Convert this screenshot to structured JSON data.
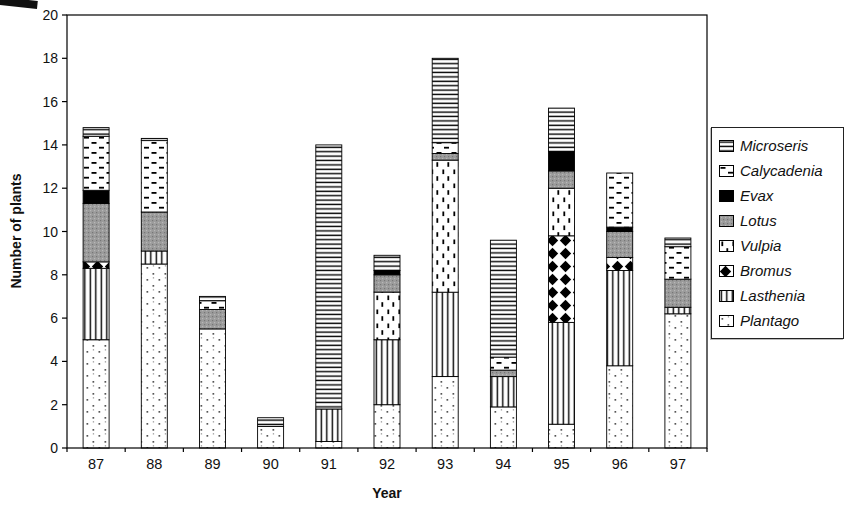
{
  "figure": {
    "background": "#ffffff",
    "axis_color": "#000000",
    "text_color": "#111111"
  },
  "chart_data": {
    "type": "stacked-bar",
    "xlabel": "Year",
    "ylabel": "Number of plants",
    "categories": [
      "87",
      "88",
      "89",
      "90",
      "91",
      "92",
      "93",
      "94",
      "95",
      "96",
      "97"
    ],
    "ylim": [
      0,
      20
    ],
    "yticks": [
      0,
      2,
      4,
      6,
      8,
      10,
      12,
      14,
      16,
      18,
      20
    ],
    "grid": false,
    "legend_position": "right",
    "bar_outline_color": "#000000",
    "series": [
      {
        "name": "Plantago",
        "pattern": "dots",
        "fill_colors": [
          "#ffffff",
          "#444444"
        ],
        "values": [
          5.0,
          8.5,
          5.5,
          1.0,
          0.3,
          2.0,
          3.3,
          1.9,
          1.1,
          3.8,
          6.2
        ]
      },
      {
        "name": "Lasthenia",
        "pattern": "vertical-lines",
        "fill_colors": [
          "#ffffff",
          "#000000"
        ],
        "values": [
          3.3,
          0.6,
          0,
          0,
          1.5,
          3.0,
          3.9,
          1.4,
          4.7,
          4.4,
          0.3
        ]
      },
      {
        "name": "Bromus",
        "pattern": "diamonds",
        "fill_colors": [
          "#ffffff",
          "#000000"
        ],
        "values": [
          0.3,
          0,
          0,
          0,
          0,
          0,
          0,
          0,
          4.0,
          0.6,
          0
        ]
      },
      {
        "name": "Vulpia",
        "pattern": "vertical-dashes",
        "fill_colors": [
          "#ffffff",
          "#000000"
        ],
        "values": [
          0,
          0,
          0,
          0,
          0,
          2.2,
          6.1,
          0,
          2.2,
          0,
          0
        ]
      },
      {
        "name": "Lotus",
        "pattern": "solid-gray",
        "fill_colors": [
          "#9b9b9b"
        ],
        "values": [
          2.7,
          1.8,
          0.9,
          0,
          0,
          0.8,
          0.3,
          0.3,
          0.8,
          1.2,
          1.3
        ]
      },
      {
        "name": "Evax",
        "pattern": "solid-black",
        "fill_colors": [
          "#000000"
        ],
        "values": [
          0.6,
          0,
          0,
          0,
          0,
          0.2,
          0,
          0,
          0.9,
          0.2,
          0
        ]
      },
      {
        "name": "Calycadenia",
        "pattern": "horizontal-dashes",
        "fill_colors": [
          "#ffffff",
          "#000000"
        ],
        "values": [
          2.5,
          3.3,
          0.4,
          0,
          0,
          0,
          0.5,
          0.6,
          0,
          2.5,
          1.5
        ]
      },
      {
        "name": "Microseris",
        "pattern": "horizontal-lines",
        "fill_colors": [
          "#ffffff",
          "#000000"
        ],
        "values": [
          0.4,
          0.1,
          0.2,
          0.4,
          12.2,
          0.7,
          3.9,
          5.4,
          2.0,
          0,
          0.4
        ]
      }
    ],
    "legend_order_top_to_bottom": [
      "Microseris",
      "Calycadenia",
      "Evax",
      "Lotus",
      "Vulpia",
      "Bromus",
      "Lasthenia",
      "Plantago"
    ],
    "totals": [
      14.8,
      14.3,
      7.0,
      1.4,
      14.0,
      8.9,
      18.0,
      9.6,
      15.7,
      12.7,
      9.7
    ]
  }
}
